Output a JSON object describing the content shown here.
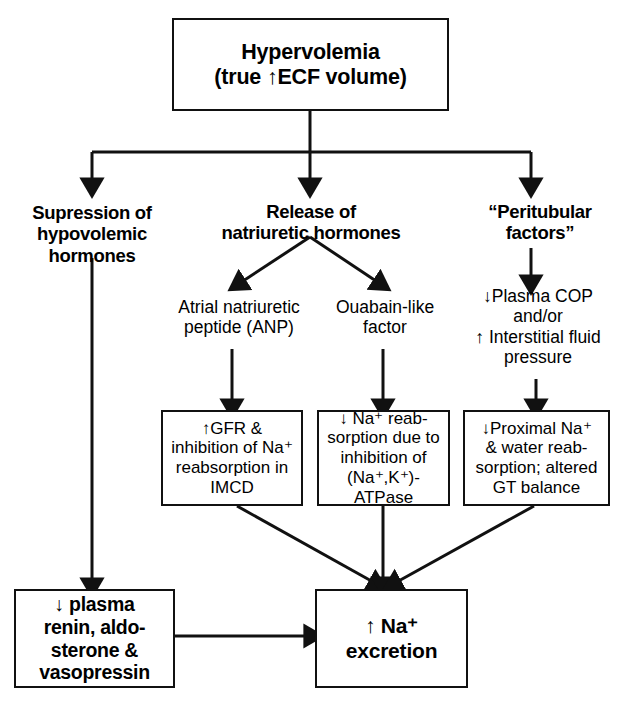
{
  "diagram": {
    "background_color": "#ffffff",
    "line_color": "#111111",
    "text_color": "#000000"
  },
  "nodes": {
    "hypervolemia": {
      "label": "Hypervolemia\n(true ↑ECF volume)",
      "style": "boxed-bold"
    },
    "suppression": {
      "label": "Supression of\nhypovolemic\nhormones",
      "style": "plain-bold"
    },
    "release": {
      "label": "Release of\nnatriuretic hormones",
      "style": "plain-bold"
    },
    "peritubular": {
      "label": "“Peritubular\nfactors”",
      "style": "plain-bold"
    },
    "anp": {
      "label": "Atrial natriuretic\npeptide (ANP)",
      "style": "plain"
    },
    "ouabain": {
      "label": "Ouabain-like\nfactor",
      "style": "plain"
    },
    "plasma_cop": {
      "label": "↓Plasma COP\nand/or\n↑ Interstitial fluid\npressure",
      "style": "plain"
    },
    "gfr_box": {
      "label": "↑GFR &\ninhibition of Na⁺\nreabsorption in\nIMCD",
      "style": "boxed-plain"
    },
    "na_reabsorption_box": {
      "label": "↓ Na⁺ reab-\nsorption due to\ninhibition of\n(Na⁺,K⁺)-ATPase",
      "style": "boxed-plain"
    },
    "proximal_box": {
      "label": "↓Proximal Na⁺\n& water reab-\nsorption; altered\nGT balance",
      "style": "boxed-plain"
    },
    "plasma_renin_box": {
      "label": "↓ plasma\nrenin, aldo-\nsterone &\nvasopressin",
      "style": "boxed-bold"
    },
    "na_excretion_box": {
      "label": "↑ Na⁺\nexcretion",
      "style": "boxed-bold"
    }
  },
  "connections": [
    {
      "name": "hypervolemia-to-suppression",
      "from": "hypervolemia",
      "to": "suppression",
      "kind": "elbow-down"
    },
    {
      "name": "hypervolemia-to-release",
      "from": "hypervolemia",
      "to": "release",
      "kind": "straight-down"
    },
    {
      "name": "hypervolemia-to-peritubular",
      "from": "hypervolemia",
      "to": "peritubular",
      "kind": "elbow-down"
    },
    {
      "name": "release-to-anp",
      "from": "release",
      "to": "anp",
      "kind": "diagonal-down-left"
    },
    {
      "name": "release-to-ouabain",
      "from": "release",
      "to": "ouabain",
      "kind": "diagonal-down-right"
    },
    {
      "name": "peritubular-to-plasma-cop",
      "from": "peritubular",
      "to": "plasma_cop",
      "kind": "straight-down"
    },
    {
      "name": "anp-to-gfr-box",
      "from": "anp",
      "to": "gfr_box",
      "kind": "straight-down"
    },
    {
      "name": "ouabain-to-na-reabsorption-box",
      "from": "ouabain",
      "to": "na_reabsorption_box",
      "kind": "straight-down"
    },
    {
      "name": "plasma-cop-to-proximal-box",
      "from": "plasma_cop",
      "to": "proximal_box",
      "kind": "straight-down"
    },
    {
      "name": "suppression-to-plasma-renin-box",
      "from": "suppression",
      "to": "plasma_renin_box",
      "kind": "straight-down-long"
    },
    {
      "name": "gfr-box-to-na-excretion-box",
      "from": "gfr_box",
      "to": "na_excretion_box",
      "kind": "diagonal-down-right"
    },
    {
      "name": "na-reabsorption-box-to-na-excretion-box",
      "from": "na_reabsorption_box",
      "to": "na_excretion_box",
      "kind": "straight-down"
    },
    {
      "name": "proximal-box-to-na-excretion-box",
      "from": "proximal_box",
      "to": "na_excretion_box",
      "kind": "diagonal-down-left"
    },
    {
      "name": "plasma-renin-box-to-na-excretion-box",
      "from": "plasma_renin_box",
      "to": "na_excretion_box",
      "kind": "straight-right"
    }
  ]
}
